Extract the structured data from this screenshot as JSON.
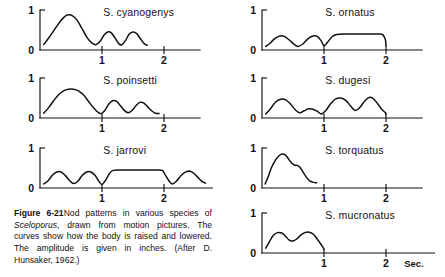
{
  "figure": {
    "number": "Figure 6-21",
    "caption_lead": "Figure 6-21",
    "caption_part1": "Nod patterns in various species of ",
    "caption_species": "Sceloporus",
    "caption_part2": ", drawn from motion pictures. The curves show how the body is raised and lowered. The amplitude is given in inches. (After D. Hunsaker, 1962.)"
  },
  "axes": {
    "y_tick_top": "1",
    "y_tick_bottom": "0",
    "x_tick_1": "1",
    "x_tick_2": "2",
    "x_unit": "Sec.",
    "ylabel": "",
    "xlabel": "Sec."
  },
  "chart_data": {
    "type": "line",
    "title": "Nod patterns in various species of Sceloporus",
    "xlabel": "Sec.",
    "ylabel": "Amplitude (inches)",
    "xlim": [
      0,
      2.75
    ],
    "ylim": [
      0,
      1.1
    ],
    "xticks": [
      1,
      2
    ],
    "yticks": [
      0,
      1
    ],
    "grid": false,
    "legend": "none",
    "panel_layout": {
      "columns": 2,
      "left_column_panels": 3,
      "right_column_panels": 4
    },
    "series": [
      {
        "name": "S. cyanogenys",
        "column": "left",
        "row": 1,
        "description": "One tall leading nod near 0.45 s reaching 0.88, followed by two smaller nods of about 0.45 amplitude; trace ends near 1.5 s.",
        "points": [
          [
            0.06,
            0.14
          ],
          [
            0.14,
            0.3
          ],
          [
            0.22,
            0.48
          ],
          [
            0.3,
            0.66
          ],
          [
            0.38,
            0.81
          ],
          [
            0.45,
            0.88
          ],
          [
            0.52,
            0.86
          ],
          [
            0.6,
            0.74
          ],
          [
            0.68,
            0.53
          ],
          [
            0.76,
            0.31
          ],
          [
            0.84,
            0.17
          ],
          [
            0.9,
            0.13
          ],
          [
            0.97,
            0.22
          ],
          [
            1.03,
            0.37
          ],
          [
            1.09,
            0.45
          ],
          [
            1.15,
            0.43
          ],
          [
            1.21,
            0.3
          ],
          [
            1.27,
            0.16
          ],
          [
            1.32,
            0.13
          ],
          [
            1.38,
            0.24
          ],
          [
            1.44,
            0.4
          ],
          [
            1.5,
            0.45
          ],
          [
            1.56,
            0.41
          ],
          [
            1.62,
            0.28
          ],
          [
            1.68,
            0.16
          ],
          [
            1.73,
            0.12
          ]
        ]
      },
      {
        "name": "S. poinsetti",
        "column": "left",
        "row": 2,
        "description": "Broad rounded leading nod peaking about 0.72 with a flattened crest, then two lower nods near 0.42 and 0.38; trace ends near 1.8 s.",
        "points": [
          [
            0.06,
            0.12
          ],
          [
            0.14,
            0.26
          ],
          [
            0.22,
            0.43
          ],
          [
            0.3,
            0.58
          ],
          [
            0.38,
            0.68
          ],
          [
            0.46,
            0.72
          ],
          [
            0.54,
            0.72
          ],
          [
            0.62,
            0.68
          ],
          [
            0.7,
            0.58
          ],
          [
            0.78,
            0.42
          ],
          [
            0.86,
            0.26
          ],
          [
            0.93,
            0.15
          ],
          [
            0.99,
            0.11
          ],
          [
            1.05,
            0.2
          ],
          [
            1.11,
            0.35
          ],
          [
            1.17,
            0.43
          ],
          [
            1.23,
            0.42
          ],
          [
            1.29,
            0.32
          ],
          [
            1.36,
            0.19
          ],
          [
            1.42,
            0.13
          ],
          [
            1.48,
            0.18
          ],
          [
            1.55,
            0.31
          ],
          [
            1.61,
            0.39
          ],
          [
            1.67,
            0.38
          ],
          [
            1.73,
            0.29
          ],
          [
            1.8,
            0.18
          ],
          [
            1.86,
            0.12
          ],
          [
            1.92,
            0.11
          ]
        ]
      },
      {
        "name": "S. jarrovi",
        "column": "left",
        "row": 3,
        "description": "Two low rounded nods near 0.40, a sharp dip at 1.0 s, a long flat plateau at about 0.45 from 1.15 to 2.0 s, a dip, then two more rounded nods; trace ends near 2.7 s.",
        "points": [
          [
            0.06,
            0.1
          ],
          [
            0.13,
            0.18
          ],
          [
            0.2,
            0.32
          ],
          [
            0.27,
            0.4
          ],
          [
            0.34,
            0.4
          ],
          [
            0.41,
            0.31
          ],
          [
            0.48,
            0.18
          ],
          [
            0.54,
            0.11
          ],
          [
            0.61,
            0.17
          ],
          [
            0.68,
            0.31
          ],
          [
            0.75,
            0.4
          ],
          [
            0.82,
            0.4
          ],
          [
            0.89,
            0.31
          ],
          [
            0.95,
            0.17
          ],
          [
            1.0,
            0.09
          ],
          [
            1.06,
            0.2
          ],
          [
            1.12,
            0.36
          ],
          [
            1.18,
            0.44
          ],
          [
            1.3,
            0.45
          ],
          [
            1.5,
            0.45
          ],
          [
            1.7,
            0.45
          ],
          [
            1.88,
            0.45
          ],
          [
            1.97,
            0.44
          ],
          [
            2.02,
            0.33
          ],
          [
            2.08,
            0.18
          ],
          [
            2.13,
            0.1
          ],
          [
            2.2,
            0.17
          ],
          [
            2.28,
            0.32
          ],
          [
            2.36,
            0.41
          ],
          [
            2.44,
            0.41
          ],
          [
            2.52,
            0.31
          ],
          [
            2.6,
            0.18
          ],
          [
            2.67,
            0.12
          ]
        ]
      },
      {
        "name": "S. ornatus",
        "column": "right",
        "row": 1,
        "description": "Two low rounded nods near 0.35, a dip at 1.0 s, then a long plateau at about 0.40 that ends with a vertical drop exactly at 2.0 s.",
        "points": [
          [
            0.06,
            0.09
          ],
          [
            0.13,
            0.17
          ],
          [
            0.21,
            0.29
          ],
          [
            0.29,
            0.35
          ],
          [
            0.36,
            0.34
          ],
          [
            0.44,
            0.25
          ],
          [
            0.52,
            0.14
          ],
          [
            0.58,
            0.09
          ],
          [
            0.66,
            0.15
          ],
          [
            0.74,
            0.28
          ],
          [
            0.82,
            0.35
          ],
          [
            0.89,
            0.34
          ],
          [
            0.95,
            0.24
          ],
          [
            1.0,
            0.11
          ],
          [
            1.06,
            0.2
          ],
          [
            1.13,
            0.33
          ],
          [
            1.2,
            0.39
          ],
          [
            1.35,
            0.4
          ],
          [
            1.55,
            0.4
          ],
          [
            1.75,
            0.4
          ],
          [
            1.88,
            0.4
          ],
          [
            1.95,
            0.38
          ],
          [
            1.99,
            0.26
          ],
          [
            2.0,
            0.1
          ]
        ]
      },
      {
        "name": "S. dugesi",
        "column": "right",
        "row": 2,
        "description": "A leading nod near 0.47, a small low nod near 0.22, then two taller nods near 0.50 and 0.52; trace ends with a drop at 2.0 s.",
        "points": [
          [
            0.06,
            0.1
          ],
          [
            0.14,
            0.24
          ],
          [
            0.22,
            0.4
          ],
          [
            0.3,
            0.47
          ],
          [
            0.38,
            0.46
          ],
          [
            0.46,
            0.35
          ],
          [
            0.54,
            0.2
          ],
          [
            0.61,
            0.13
          ],
          [
            0.68,
            0.18
          ],
          [
            0.75,
            0.23
          ],
          [
            0.82,
            0.22
          ],
          [
            0.89,
            0.17
          ],
          [
            0.96,
            0.1
          ],
          [
            1.03,
            0.19
          ],
          [
            1.11,
            0.36
          ],
          [
            1.19,
            0.48
          ],
          [
            1.27,
            0.5
          ],
          [
            1.35,
            0.44
          ],
          [
            1.43,
            0.3
          ],
          [
            1.5,
            0.19
          ],
          [
            1.57,
            0.25
          ],
          [
            1.65,
            0.41
          ],
          [
            1.72,
            0.51
          ],
          [
            1.79,
            0.49
          ],
          [
            1.86,
            0.37
          ],
          [
            1.93,
            0.22
          ],
          [
            1.99,
            0.13
          ],
          [
            2.0,
            0.09
          ]
        ]
      },
      {
        "name": "S. torquatus",
        "column": "right",
        "row": 3,
        "description": "A single brief burst: steep rise to about 0.85 at 0.30 s, then a stepped shoulder descending to baseline near 0.78 s; no further nods.",
        "points": [
          [
            0.05,
            0.1
          ],
          [
            0.1,
            0.28
          ],
          [
            0.15,
            0.5
          ],
          [
            0.21,
            0.68
          ],
          [
            0.27,
            0.8
          ],
          [
            0.32,
            0.85
          ],
          [
            0.38,
            0.82
          ],
          [
            0.43,
            0.72
          ],
          [
            0.48,
            0.62
          ],
          [
            0.53,
            0.57
          ],
          [
            0.58,
            0.56
          ],
          [
            0.62,
            0.5
          ],
          [
            0.67,
            0.38
          ],
          [
            0.72,
            0.26
          ],
          [
            0.77,
            0.18
          ],
          [
            0.83,
            0.14
          ],
          [
            0.88,
            0.13
          ]
        ]
      },
      {
        "name": "S. mucronatus",
        "column": "right",
        "row": 4,
        "description": "Three rounded nods of roughly equal height (about 0.50, 0.38, 0.52) compressed into the first second; trace drops vertically at 1.0 s.",
        "points": [
          [
            0.06,
            0.12
          ],
          [
            0.12,
            0.28
          ],
          [
            0.18,
            0.44
          ],
          [
            0.25,
            0.51
          ],
          [
            0.32,
            0.5
          ],
          [
            0.38,
            0.42
          ],
          [
            0.44,
            0.32
          ],
          [
            0.5,
            0.3
          ],
          [
            0.56,
            0.35
          ],
          [
            0.62,
            0.44
          ],
          [
            0.69,
            0.51
          ],
          [
            0.76,
            0.52
          ],
          [
            0.83,
            0.47
          ],
          [
            0.89,
            0.35
          ],
          [
            0.95,
            0.22
          ],
          [
            0.99,
            0.13
          ],
          [
            1.0,
            0.09
          ]
        ]
      }
    ]
  },
  "panels": [
    {
      "id": "cyanogenys",
      "label": "S. cyanogenys"
    },
    {
      "id": "poinsetti",
      "label": "S. poinsetti"
    },
    {
      "id": "jarrovi",
      "label": "S. jarrovi"
    },
    {
      "id": "ornatus",
      "label": "S. ornatus"
    },
    {
      "id": "dugesi",
      "label": "S. dugesi"
    },
    {
      "id": "torquatus",
      "label": "S. torquatus"
    },
    {
      "id": "mucronatus",
      "label": "S. mucronatus"
    }
  ]
}
